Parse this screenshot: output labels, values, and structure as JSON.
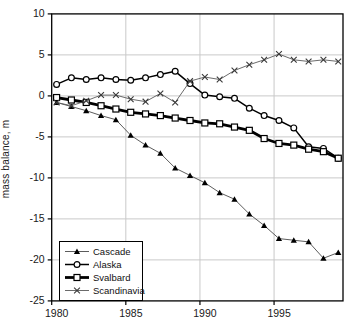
{
  "figure": {
    "title": "",
    "y_axis_label": "mass balance, m"
  },
  "chart_data": {
    "type": "line",
    "title": "",
    "xlabel": "",
    "ylabel": "mass balance, m",
    "xlim": [
      1980,
      1999.65
    ],
    "ylim": [
      -25,
      10
    ],
    "xticks": [
      1980,
      1985,
      1990,
      1995
    ],
    "yticks": [
      10,
      5,
      0,
      -5,
      -10,
      -15,
      -20,
      -25
    ],
    "grid": true,
    "grid_color": "#c9c9c9",
    "axis_color": "#000000",
    "legend_position": "bottom-left",
    "x": [
      1980,
      1981,
      1982,
      1983,
      1984,
      1985,
      1986,
      1987,
      1988,
      1989,
      1990,
      1991,
      1992,
      1993,
      1994,
      1995,
      1996,
      1997,
      1998,
      1999
    ],
    "series": [
      {
        "name": "Cascade",
        "marker": "filled-triangle",
        "line_color": "#4a4a4a",
        "marker_color": "#000000",
        "line_width": 0.9,
        "values": [
          -0.8,
          -1.3,
          -1.8,
          -2.4,
          -2.9,
          -4.8,
          -6.0,
          -7.0,
          -8.8,
          -9.7,
          -10.6,
          -11.8,
          -12.6,
          -14.4,
          -15.8,
          -17.4,
          -17.6,
          -17.8,
          -19.8,
          -19.1
        ]
      },
      {
        "name": "Alaska",
        "marker": "open-circle",
        "line_color": "#000000",
        "marker_color": "#000000",
        "line_width": 1.5,
        "values": [
          1.4,
          2.2,
          2.0,
          2.2,
          2.0,
          1.9,
          2.2,
          2.6,
          3.0,
          1.5,
          0.1,
          -0.1,
          -0.3,
          -1.5,
          -2.4,
          -3.0,
          -3.9,
          -6.2,
          -6.4,
          -7.6
        ]
      },
      {
        "name": "Svalbard",
        "marker": "open-square",
        "line_color": "#000000",
        "marker_color": "#000000",
        "line_width": 2.8,
        "values": [
          -0.2,
          -0.5,
          -0.8,
          -1.2,
          -1.6,
          -2.0,
          -2.2,
          -2.4,
          -2.7,
          -3.0,
          -3.3,
          -3.4,
          -3.8,
          -4.2,
          -5.2,
          -5.8,
          -6.0,
          -6.5,
          -6.8,
          -7.6
        ]
      },
      {
        "name": "Scandinavia",
        "marker": "x-cross",
        "line_color": "#5a5a5a",
        "marker_color": "#3a3a3a",
        "line_width": 0.9,
        "values": [
          -0.8,
          -1.2,
          -0.6,
          0.1,
          0.1,
          -0.4,
          -0.7,
          0.3,
          -0.8,
          1.8,
          2.3,
          2.0,
          3.1,
          3.8,
          4.4,
          5.1,
          4.4,
          4.2,
          4.4,
          4.2
        ]
      }
    ]
  }
}
